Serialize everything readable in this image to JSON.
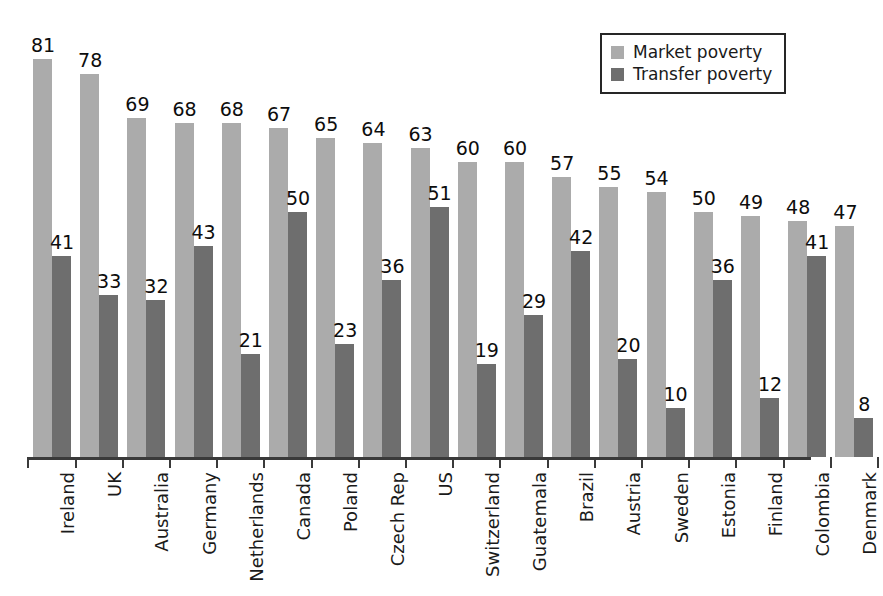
{
  "legend": {
    "position": "top-right",
    "entries": [
      {
        "label": "Market poverty",
        "color": "#ababab",
        "swatch_name": "market-poverty-swatch"
      },
      {
        "label": "Transfer poverty",
        "color": "#6e6e6e",
        "swatch_name": "transfer-poverty-swatch"
      }
    ]
  },
  "chart_data": {
    "type": "bar",
    "title": "",
    "subtitle": "",
    "xlabel": "",
    "ylabel": "",
    "ylim": [
      0,
      85
    ],
    "grid": false,
    "legend_position": "top-right",
    "orientation": "vertical",
    "value_labels": true,
    "categories": [
      "Ireland",
      "UK",
      "Australia",
      "Germany",
      "Netherlands",
      "Canada",
      "Poland",
      "Czech Rep",
      "US",
      "Switzerland",
      "Guatemala",
      "Brazil",
      "Austria",
      "Sweden",
      "Estonia",
      "Finland",
      "Colombia",
      "Denmark"
    ],
    "series": [
      {
        "name": "Market poverty",
        "color": "#ababab",
        "values": [
          81,
          78,
          69,
          68,
          68,
          67,
          65,
          64,
          63,
          60,
          60,
          57,
          55,
          54,
          50,
          49,
          48,
          47
        ]
      },
      {
        "name": "Transfer poverty",
        "color": "#6e6e6e",
        "values": [
          41,
          33,
          32,
          43,
          21,
          50,
          23,
          36,
          51,
          19,
          29,
          42,
          20,
          10,
          36,
          12,
          41,
          8
        ]
      }
    ]
  },
  "axis": {
    "line_color": "#3a3a3a",
    "tick_count": 19
  }
}
